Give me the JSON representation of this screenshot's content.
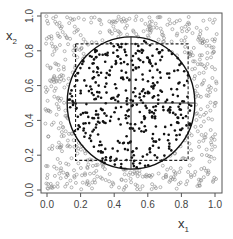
{
  "chart_data": {
    "type": "scatter",
    "title": "",
    "xlabel": "x1",
    "ylabel": "x2",
    "xlim": [
      -0.04,
      1.04
    ],
    "ylim": [
      -0.01,
      1.05
    ],
    "x_ticks": [
      "0.0",
      "0.2",
      "0.4",
      "0.6",
      "0.8",
      "1.0"
    ],
    "y_ticks": [
      "0.0",
      "0.2",
      "0.4",
      "0.6",
      "0.8",
      "1.0"
    ],
    "grid": false,
    "legend": null,
    "series": [
      {
        "name": "inside-circle",
        "marker": "filled-circle",
        "color": "#111111",
        "approx_count": 520
      },
      {
        "name": "outside-circle",
        "marker": "open-circle",
        "color": "#8a8a8a",
        "approx_count": 450
      }
    ],
    "shapes": {
      "circle": {
        "cx": 0.5,
        "cy": 0.5,
        "r": 0.38,
        "style": "solid",
        "color": "#111111"
      },
      "dashed_square": {
        "x0": 0.17,
        "y0": 0.17,
        "x1": 0.84,
        "y1": 0.84,
        "style": "dashed",
        "color": "#222222"
      },
      "crosshair": {
        "horizontal_y": 0.5,
        "vertical_x": 0.5,
        "extent": "circle-diameter",
        "color": "#222222"
      }
    },
    "generator": {
      "seed": 20240517,
      "total_points": 980
    }
  },
  "axes": {
    "x_label_main": "x",
    "x_label_sub": "1",
    "y_label_main": "x",
    "y_label_sub": "2"
  }
}
